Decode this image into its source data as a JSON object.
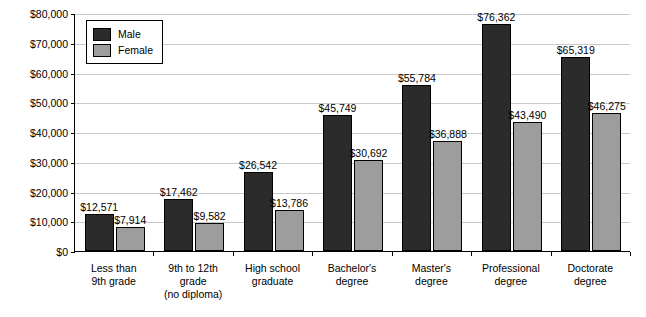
{
  "chart_data": {
    "type": "bar",
    "title": "",
    "xlabel": "",
    "ylabel": "",
    "ylim": [
      0,
      80000
    ],
    "grid": true,
    "legend_position": "top-left",
    "categories": [
      "Less than\n9th grade",
      "9th to 12th\ngrade\n(no diploma)",
      "High school\ngraduate",
      "Bachelor's\ndegree",
      "Master's\ndegree",
      "Professional\ndegree",
      "Doctorate\ndegree"
    ],
    "ytick_labels": [
      "$0",
      "$10,000",
      "$20,000",
      "$30,000",
      "$40,000",
      "$50,000",
      "$60,000",
      "$70,000",
      "$80,000"
    ],
    "ytick_values": [
      0,
      10000,
      20000,
      30000,
      40000,
      50000,
      60000,
      70000,
      80000
    ],
    "series": [
      {
        "name": "Male",
        "color": "#2b2b2b",
        "values": [
          12571,
          17462,
          26542,
          45749,
          55784,
          76362,
          65319
        ],
        "labels": [
          "$12,571",
          "$17,462",
          "$26,542",
          "$45,749",
          "$55,784",
          "$76,362",
          "$65,319"
        ]
      },
      {
        "name": "Female",
        "color": "#9d9d9d",
        "values": [
          7914,
          9582,
          13786,
          30692,
          36888,
          43490,
          46275
        ],
        "labels": [
          "$7,914",
          "$9,582",
          "$13,786",
          "$30,692",
          "$36,888",
          "$43,490",
          "$46,275"
        ]
      }
    ]
  },
  "legend": {
    "items": [
      {
        "label": "Male"
      },
      {
        "label": "Female"
      }
    ]
  }
}
